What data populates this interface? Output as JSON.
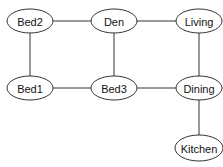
{
  "diagram": {
    "type": "undirected-graph",
    "nodes": [
      {
        "id": "bed2",
        "label": "Bed2",
        "cx": 30,
        "cy": 21,
        "rx": 23,
        "ry": 12
      },
      {
        "id": "den",
        "label": "Den",
        "cx": 114,
        "cy": 21,
        "rx": 23,
        "ry": 12
      },
      {
        "id": "living",
        "label": "Living",
        "cx": 199,
        "cy": 21,
        "rx": 23,
        "ry": 12
      },
      {
        "id": "bed1",
        "label": "Bed1",
        "cx": 30,
        "cy": 88,
        "rx": 23,
        "ry": 12
      },
      {
        "id": "bed3",
        "label": "Bed3",
        "cx": 114,
        "cy": 88,
        "rx": 23,
        "ry": 12
      },
      {
        "id": "dining",
        "label": "Dining",
        "cx": 199,
        "cy": 88,
        "rx": 23,
        "ry": 12
      },
      {
        "id": "kitchen",
        "label": "Kitchen",
        "cx": 199,
        "cy": 148,
        "rx": 24,
        "ry": 13
      }
    ],
    "edges": [
      {
        "from": "bed2",
        "to": "den"
      },
      {
        "from": "den",
        "to": "living"
      },
      {
        "from": "bed2",
        "to": "bed1"
      },
      {
        "from": "den",
        "to": "bed3"
      },
      {
        "from": "living",
        "to": "dining"
      },
      {
        "from": "bed1",
        "to": "bed3"
      },
      {
        "from": "bed3",
        "to": "dining"
      },
      {
        "from": "dining",
        "to": "kitchen"
      }
    ],
    "colors": {
      "stroke": "#333333",
      "fill": "#ffffff",
      "text": "#111111"
    }
  }
}
